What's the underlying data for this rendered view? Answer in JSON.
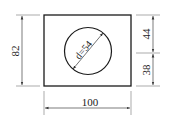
{
  "drawing": {
    "shape": "rectangle-with-circular-hole",
    "rectangle": {
      "width_label": "100",
      "height_label": "82"
    },
    "circle": {
      "diameter_label": "d=54"
    },
    "right_dimensions": {
      "upper_label": "44",
      "lower_label": "38"
    }
  },
  "colors": {
    "outline": "#1a1a1a",
    "dimension_line": "#444444",
    "extension_line": "#888888",
    "background": "#ffffff"
  }
}
